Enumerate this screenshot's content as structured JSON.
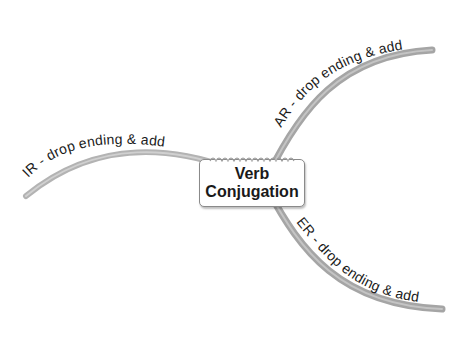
{
  "diagram": {
    "type": "mind-map",
    "center_node": {
      "line1": "Verb",
      "line2": "Conjugation",
      "full_text": "Verb Conjugation"
    },
    "branches": [
      {
        "id": "ar",
        "label": "AR - drop ending & add",
        "direction": "upper-right"
      },
      {
        "id": "ir",
        "label": "IR - drop ending & add",
        "direction": "left"
      },
      {
        "id": "er",
        "label": "ER - drop ending & add",
        "direction": "lower-right"
      }
    ],
    "colors": {
      "branch_stroke": "#a8a8a8",
      "branch_highlight": "#c8c8c8",
      "text": "#1a1a1a",
      "node_border": "#8a8a8a",
      "background": "#ffffff"
    }
  }
}
